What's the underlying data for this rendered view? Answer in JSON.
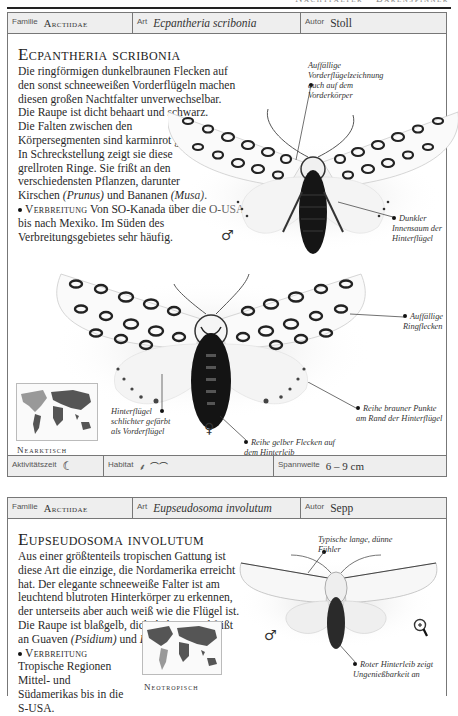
{
  "page": {
    "running_head": "Nachtfalter · Bärenspinner"
  },
  "entries": [
    {
      "header": {
        "family_label": "Familie",
        "family": "Arctiidae",
        "species_label": "Art",
        "species": "Ecpantheria scribonia",
        "author_label": "Autor",
        "author": "Stoll"
      },
      "title": "Ecpantheria scribonia",
      "description": {
        "p1": "Die ringförmigen dunkelbraunen Flecken auf den sonst schneeweißen Vorderflügeln machen diesen großen Nachtfalter unverwechselbar.",
        "p2_a": "Die Raupe ist dicht behaart und schwarz. Die Falten zwischen den Körpersegmenten sind karminrot gefärbt. In Schreckstellung zeigt sie diese grellroten Ringe. Sie frißt an den verschiedensten Pflanzen, darunter Kirschen ",
        "p2_prunus": "(Prunus)",
        "p2_b": " und Bananen ",
        "p2_musa": "(Musa)",
        "p2_c": ".",
        "distribution_label": "Verbreitung",
        "distribution": " Von SO-Kanada über die O-USA bis nach Mexiko. Im Süden des Verbreitungsgebietes sehr häufig."
      },
      "annotations": {
        "forewing_pattern": "Auffällige Vorderflügelzeichnung auch auf dem Vorderkörper",
        "dark_inner_margin": "Dunkler Innensaum der Hinterflügel",
        "ring_spots": "Auffällige Ringflecken",
        "brown_dots": "Reihe brauner Punkte am Rand der Hinterflügel",
        "hindwing_plain": "Hinterflügel schlichter gefärbt als Vorderflügel",
        "yellow_spots": "Reihe gelber Flecken auf dem Hinterleib"
      },
      "male_symbol": "♂",
      "female_symbol": "♀",
      "region": "Nearktisch",
      "info": {
        "activity_label": "Aktivitätszeit",
        "activity_icon": "moon-icon",
        "habitat_label": "Habitat",
        "habitat_icons": [
          "plant-icon",
          "landscape-icon"
        ],
        "wingspan_label": "Spannweite",
        "wingspan": "6 – 9 cm"
      }
    },
    {
      "header": {
        "family_label": "Familie",
        "family": "Arctiidae",
        "species_label": "Art",
        "species": "Eupseudosoma involutum",
        "author_label": "Autor",
        "author": "Sepp"
      },
      "title": "Eupseudosoma involutum",
      "description": {
        "p1": "Aus einer größtenteils tropischen Gattung ist diese Art die einzige, die Nordamerika erreicht hat. Der elegante schneeweiße Falter ist am leuchtend blutroten Hinterkörper zu erkennen, der unterseits aber auch weiß wie die Flügel ist. Die Raupe ist blaßgelb, dicht behaart und frißt an Guaven ",
        "psidium": "(Psidium)",
        "p1_b": " und ",
        "eugenia": "Eugenia",
        "p1_c": "-Arten.",
        "distribution_label": "Verbreitung",
        "distribution": " Tropische Regionen Mittel- und Südamerikas bis in die S-USA."
      },
      "annotations": {
        "antennae": "Typische lange, dünne Fühler",
        "red_abdomen": "Roter Hinterleib zeigt Ungenießbarkeit an"
      },
      "male_symbol": "♂",
      "magnifier_icon": "magnifier-icon",
      "region": "Neotropisch"
    }
  ]
}
